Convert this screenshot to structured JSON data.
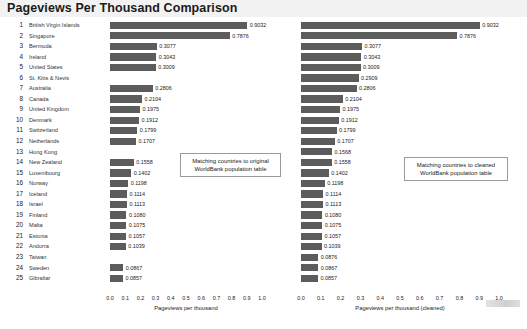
{
  "header": {
    "title": "Pageviews Per Thousand Comparison"
  },
  "annotations": {
    "left": "Matching countries to original WorldBank population table",
    "right": "Matching countries to cleaned WorldBank population table"
  },
  "artifact": {
    "name": "toolbar-artifact"
  },
  "chart_data": [
    {
      "type": "bar",
      "orientation": "horizontal",
      "id": "left",
      "title": "Pageviews Per Thousand Comparison",
      "xlabel": "Pageviews per thousand",
      "ylabel": "",
      "xlim": [
        0.0,
        1.0
      ],
      "grid": false,
      "legend": "none",
      "annotation": "Matching countries to original WorldBank population table",
      "ticks": [
        "0.0",
        "0.1",
        "0.2",
        "0.3",
        "0.4",
        "0.5",
        "0.6",
        "0.7",
        "0.8",
        "0.9",
        "1.0"
      ],
      "categories": [
        "British Virgin Islands",
        "Singapore",
        "Bermuda",
        "Ireland",
        "United States",
        "St. Kitts & Nevis",
        "Australia",
        "Canada",
        "United Kingdom",
        "Denmark",
        "Switzerland",
        "Netherlands",
        "Hong Kong",
        "New Zealand",
        "Luxembourg",
        "Norway",
        "Iceland",
        "Israel",
        "Finland",
        "Malta",
        "Estonia",
        "Andorra",
        "Taiwan",
        "Sweden",
        "Gibraltar"
      ],
      "values": [
        0.9032,
        0.7876,
        0.3077,
        0.3043,
        0.3009,
        null,
        0.2806,
        0.2104,
        0.1975,
        0.1912,
        0.1799,
        0.1707,
        null,
        0.1558,
        0.1402,
        0.1198,
        0.1114,
        0.1113,
        0.108,
        0.1075,
        0.1057,
        0.1039,
        null,
        0.0867,
        0.0857
      ],
      "labels": [
        "0.9032",
        "0.7876",
        "0.3077",
        "0.3043",
        "0.3009",
        "",
        "0.2806",
        "0.2104",
        "0.1975",
        "0.1912",
        "0.1799",
        "0.1707",
        "",
        "0.1558",
        "0.1402",
        "0.1198",
        "0.1114",
        "0.1113",
        "0.1080",
        "0.1075",
        "0.1057",
        "0.1039",
        "",
        "0.0867",
        "0.0857"
      ]
    },
    {
      "type": "bar",
      "orientation": "horizontal",
      "id": "right",
      "title": "",
      "xlabel": "Pageviews per thousand (cleaned)",
      "ylabel": "",
      "xlim": [
        0.0,
        1.0
      ],
      "grid": false,
      "legend": "none",
      "annotation": "Matching countries to cleaned WorldBank population table",
      "ticks": [
        "0.0",
        "0.1",
        "0.2",
        "0.3",
        "0.4",
        "0.5",
        "0.6",
        "0.7",
        "0.8",
        "0.9",
        "1.0"
      ],
      "categories": [
        "British Virgin Islands",
        "Singapore",
        "Bermuda",
        "Ireland",
        "United States",
        "St. Kitts & Nevis",
        "Australia",
        "Canada",
        "United Kingdom",
        "Denmark",
        "Switzerland",
        "Netherlands",
        "Hong Kong",
        "New Zealand",
        "Luxembourg",
        "Norway",
        "Iceland",
        "Israel",
        "Finland",
        "Malta",
        "Estonia",
        "Andorra",
        "Taiwan",
        "Sweden",
        "Gibraltar"
      ],
      "values": [
        0.9032,
        0.7876,
        0.3077,
        0.3043,
        0.3009,
        0.2909,
        0.2806,
        0.2104,
        0.1975,
        0.1912,
        0.1799,
        0.1707,
        0.1568,
        0.1558,
        0.1402,
        0.1198,
        0.1114,
        0.1113,
        0.108,
        0.1075,
        0.1057,
        0.1039,
        0.0876,
        0.0867,
        0.0857
      ],
      "labels": [
        "0.9032",
        "0.7876",
        "0.3077",
        "0.3043",
        "0.3009",
        "0.2909",
        "0.2806",
        "0.2104",
        "0.1975",
        "0.1912",
        "0.1799",
        "0.1707",
        "0.1568",
        "0.1558",
        "0.1402",
        "0.1198",
        "0.1114",
        "0.1113",
        "0.1080",
        "0.1075",
        "0.1057",
        "0.1039",
        "0.0876",
        "0.0867",
        "0.0857"
      ]
    }
  ],
  "rows": [
    {
      "index": "1",
      "country": "British Virgin Islands"
    },
    {
      "index": "2",
      "country": "Singapore"
    },
    {
      "index": "3",
      "country": "Bermuda"
    },
    {
      "index": "4",
      "country": "Ireland"
    },
    {
      "index": "5",
      "country": "United States"
    },
    {
      "index": "6",
      "country": "St. Kitts & Nevis"
    },
    {
      "index": "7",
      "country": "Australia"
    },
    {
      "index": "8",
      "country": "Canada"
    },
    {
      "index": "9",
      "country": "United Kingdom"
    },
    {
      "index": "10",
      "country": "Denmark"
    },
    {
      "index": "11",
      "country": "Switzerland"
    },
    {
      "index": "12",
      "country": "Netherlands"
    },
    {
      "index": "13",
      "country": "Hong Kong"
    },
    {
      "index": "14",
      "country": "New Zealand"
    },
    {
      "index": "15",
      "country": "Luxembourg"
    },
    {
      "index": "16",
      "country": "Norway"
    },
    {
      "index": "17",
      "country": "Iceland"
    },
    {
      "index": "18",
      "country": "Israel"
    },
    {
      "index": "19",
      "country": "Finland"
    },
    {
      "index": "20",
      "country": "Malta"
    },
    {
      "index": "21",
      "country": "Estonia"
    },
    {
      "index": "22",
      "country": "Andorra"
    },
    {
      "index": "23",
      "country": "Taiwan"
    },
    {
      "index": "24",
      "country": "Sweden"
    },
    {
      "index": "25",
      "country": "Gibraltar"
    }
  ],
  "colors": {
    "bar": "#5c5c5c",
    "header_bg": "#f2f2f2",
    "text": "#1a1a1a"
  }
}
